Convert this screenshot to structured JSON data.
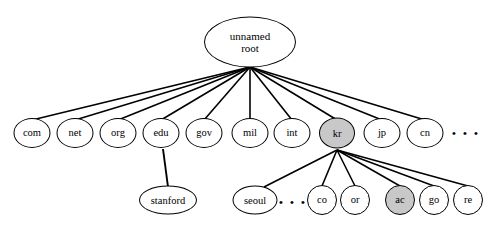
{
  "diagram": {
    "type": "tree",
    "colors": {
      "stroke": "#000000",
      "node_fill": "#ffffff",
      "shaded_fill": "#c8c8c8",
      "background": "#ffffff"
    },
    "root": {
      "id": "root",
      "label_line1": "unnamed",
      "label_line2": "root",
      "x": 250,
      "y": 42,
      "w": 92,
      "h": 51,
      "font_size": 11,
      "shaded": false
    },
    "tld_nodes": [
      {
        "id": "com",
        "label": "com",
        "x": 32,
        "y": 133,
        "w": 37,
        "h": 30,
        "font_size": 10.5,
        "shaded": false
      },
      {
        "id": "net",
        "label": "net",
        "x": 75,
        "y": 133,
        "w": 37,
        "h": 30,
        "font_size": 10.5,
        "shaded": false
      },
      {
        "id": "org",
        "label": "org",
        "x": 118,
        "y": 133,
        "w": 37,
        "h": 30,
        "font_size": 10.5,
        "shaded": false
      },
      {
        "id": "edu",
        "label": "edu",
        "x": 161,
        "y": 133,
        "w": 37,
        "h": 30,
        "font_size": 10.5,
        "shaded": false
      },
      {
        "id": "gov",
        "label": "gov",
        "x": 204,
        "y": 133,
        "w": 37,
        "h": 30,
        "font_size": 10.5,
        "shaded": false
      },
      {
        "id": "mil",
        "label": "mil",
        "x": 250,
        "y": 133,
        "w": 37,
        "h": 30,
        "font_size": 10.5,
        "shaded": false
      },
      {
        "id": "int",
        "label": "int",
        "x": 292,
        "y": 133,
        "w": 37,
        "h": 30,
        "font_size": 10.5,
        "shaded": false
      },
      {
        "id": "kr",
        "label": "kr",
        "x": 337,
        "y": 133,
        "w": 36,
        "h": 31,
        "font_size": 10.5,
        "shaded": true
      },
      {
        "id": "jp",
        "label": "jp",
        "x": 382,
        "y": 133,
        "w": 37,
        "h": 30,
        "font_size": 10.5,
        "shaded": false
      },
      {
        "id": "cn",
        "label": "cn",
        "x": 425,
        "y": 133,
        "w": 37,
        "h": 30,
        "font_size": 10.5,
        "shaded": false
      }
    ],
    "leaf_nodes": [
      {
        "id": "stanford",
        "label": "stanford",
        "x": 168,
        "y": 200,
        "w": 58,
        "h": 29,
        "font_size": 10.5,
        "shaded": false
      },
      {
        "id": "seoul",
        "label": "seoul",
        "x": 255,
        "y": 200,
        "w": 45,
        "h": 29,
        "font_size": 10.5,
        "shaded": false
      },
      {
        "id": "co",
        "label": "co",
        "x": 322,
        "y": 200,
        "w": 30,
        "h": 30,
        "font_size": 10.5,
        "shaded": false
      },
      {
        "id": "or",
        "label": "or",
        "x": 355,
        "y": 200,
        "w": 30,
        "h": 30,
        "font_size": 10.5,
        "shaded": false
      },
      {
        "id": "ac",
        "label": "ac",
        "x": 400,
        "y": 200,
        "w": 30,
        "h": 30,
        "font_size": 10.5,
        "shaded": true
      },
      {
        "id": "go",
        "label": "go",
        "x": 434,
        "y": 200,
        "w": 30,
        "h": 30,
        "font_size": 10.5,
        "shaded": false
      },
      {
        "id": "re",
        "label": "re",
        "x": 468,
        "y": 200,
        "w": 30,
        "h": 30,
        "font_size": 10.5,
        "shaded": false
      }
    ],
    "ellipses_marks": [
      {
        "id": "tld-ellipsis",
        "label": "• • •",
        "x": 466,
        "y": 133,
        "font_size": 11
      },
      {
        "id": "leaf-ellipsis",
        "label": "• • •",
        "x": 293,
        "y": 202,
        "font_size": 11
      }
    ],
    "edges": [
      {
        "id": "root-com",
        "from": "root",
        "to": "com",
        "x1": 250,
        "y1": 67,
        "x2": 32,
        "y2": 120,
        "width": 1.6
      },
      {
        "id": "root-net",
        "from": "root",
        "to": "net",
        "x1": 250,
        "y1": 67,
        "x2": 75,
        "y2": 120,
        "width": 1.6
      },
      {
        "id": "root-org",
        "from": "root",
        "to": "org",
        "x1": 250,
        "y1": 67,
        "x2": 118,
        "y2": 120,
        "width": 1.6
      },
      {
        "id": "root-edu",
        "from": "root",
        "to": "edu",
        "x1": 250,
        "y1": 67,
        "x2": 161,
        "y2": 120,
        "width": 1.6
      },
      {
        "id": "root-gov",
        "from": "root",
        "to": "gov",
        "x1": 250,
        "y1": 67,
        "x2": 204,
        "y2": 120,
        "width": 1.6
      },
      {
        "id": "root-mil",
        "from": "root",
        "to": "mil",
        "x1": 250,
        "y1": 67,
        "x2": 250,
        "y2": 120,
        "width": 1.6
      },
      {
        "id": "root-int",
        "from": "root",
        "to": "int",
        "x1": 250,
        "y1": 67,
        "x2": 292,
        "y2": 120,
        "width": 1.6
      },
      {
        "id": "root-kr",
        "from": "root",
        "to": "kr",
        "x1": 250,
        "y1": 67,
        "x2": 337,
        "y2": 120,
        "width": 1.6
      },
      {
        "id": "root-jp",
        "from": "root",
        "to": "jp",
        "x1": 250,
        "y1": 67,
        "x2": 382,
        "y2": 120,
        "width": 1.6
      },
      {
        "id": "root-cn",
        "from": "root",
        "to": "cn",
        "x1": 250,
        "y1": 67,
        "x2": 425,
        "y2": 120,
        "width": 1.6
      },
      {
        "id": "edu-stanford",
        "from": "edu",
        "to": "stanford",
        "x1": 163,
        "y1": 149,
        "x2": 168,
        "y2": 187,
        "width": 1.9
      },
      {
        "id": "kr-seoul",
        "from": "kr",
        "to": "seoul",
        "x1": 337,
        "y1": 150,
        "x2": 264,
        "y2": 187,
        "width": 1.6
      },
      {
        "id": "kr-co",
        "from": "kr",
        "to": "co",
        "x1": 337,
        "y1": 150,
        "x2": 322,
        "y2": 186,
        "width": 1.6
      },
      {
        "id": "kr-or",
        "from": "kr",
        "to": "or",
        "x1": 337,
        "y1": 150,
        "x2": 355,
        "y2": 186,
        "width": 1.6
      },
      {
        "id": "kr-ac",
        "from": "kr",
        "to": "ac",
        "x1": 337,
        "y1": 150,
        "x2": 400,
        "y2": 186,
        "width": 1.6
      },
      {
        "id": "kr-go",
        "from": "kr",
        "to": "go",
        "x1": 337,
        "y1": 150,
        "x2": 434,
        "y2": 186,
        "width": 1.6
      },
      {
        "id": "kr-re",
        "from": "kr",
        "to": "re",
        "x1": 337,
        "y1": 150,
        "x2": 468,
        "y2": 186,
        "width": 1.6
      }
    ]
  }
}
